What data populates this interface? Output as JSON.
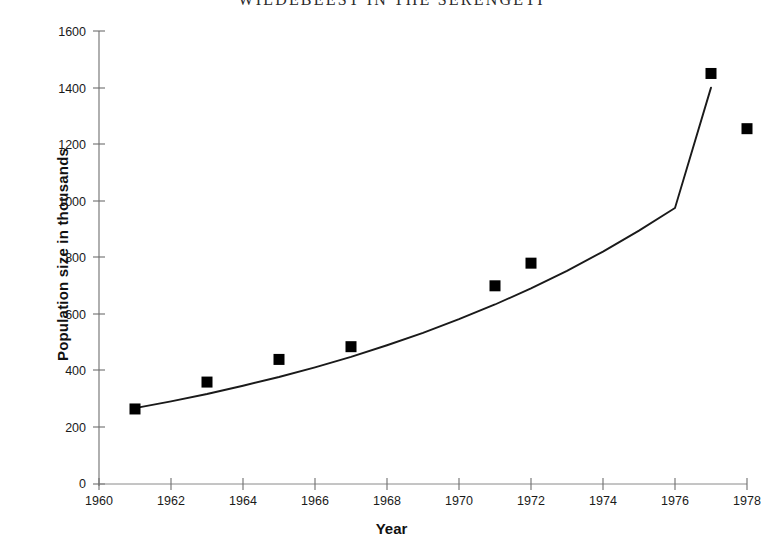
{
  "chart_data": {
    "type": "scatter",
    "title": "WILDEBEEST IN THE SERENGETI",
    "xlabel": "Year",
    "ylabel": "Population size in thousands",
    "xlim": [
      1960,
      1978
    ],
    "ylim": [
      0,
      1600
    ],
    "xticks": [
      1960,
      1962,
      1964,
      1966,
      1968,
      1970,
      1972,
      1974,
      1976,
      1978
    ],
    "yticks": [
      0,
      200,
      400,
      600,
      800,
      1000,
      1200,
      1400,
      1600
    ],
    "grid": false,
    "legend": null,
    "marker_style": "filled-square",
    "marker_color": "#000000",
    "line_color": "#1a1a1a",
    "x": [
      1961,
      1963,
      1965,
      1967,
      1971,
      1972,
      1977,
      1978
    ],
    "y": [
      265,
      360,
      440,
      485,
      700,
      780,
      1450,
      1255
    ],
    "series": [
      {
        "name": "Observed population",
        "x": [
          1961,
          1963,
          1965,
          1967,
          1971,
          1972,
          1977,
          1978
        ],
        "values": [
          265,
          360,
          440,
          485,
          700,
          780,
          1450,
          1255
        ]
      },
      {
        "name": "Fitted exponential curve",
        "type": "line",
        "x": [
          1961,
          1962,
          1963,
          1964,
          1965,
          1966,
          1967,
          1968,
          1969,
          1970,
          1971,
          1972,
          1973,
          1974,
          1975,
          1976,
          1977
        ],
        "values": [
          268,
          292,
          318,
          347,
          378,
          412,
          449,
          490,
          534,
          582,
          634,
          691,
          753,
          821,
          895,
          975,
          1400
        ]
      }
    ],
    "annotations": []
  },
  "axis": {
    "y_tick_labels": [
      "1600",
      "1400",
      "1200",
      "1000",
      "800",
      "600",
      "400",
      "200",
      "0"
    ],
    "x_tick_labels": [
      "1960",
      "1962",
      "1964",
      "1966",
      "1968",
      "1970",
      "1972",
      "1974",
      "1976",
      "1978"
    ],
    "y_title": "Population size in thousands",
    "x_title": "Year"
  },
  "header": {
    "title": "WILDEBEEST IN THE SERENGETI"
  }
}
